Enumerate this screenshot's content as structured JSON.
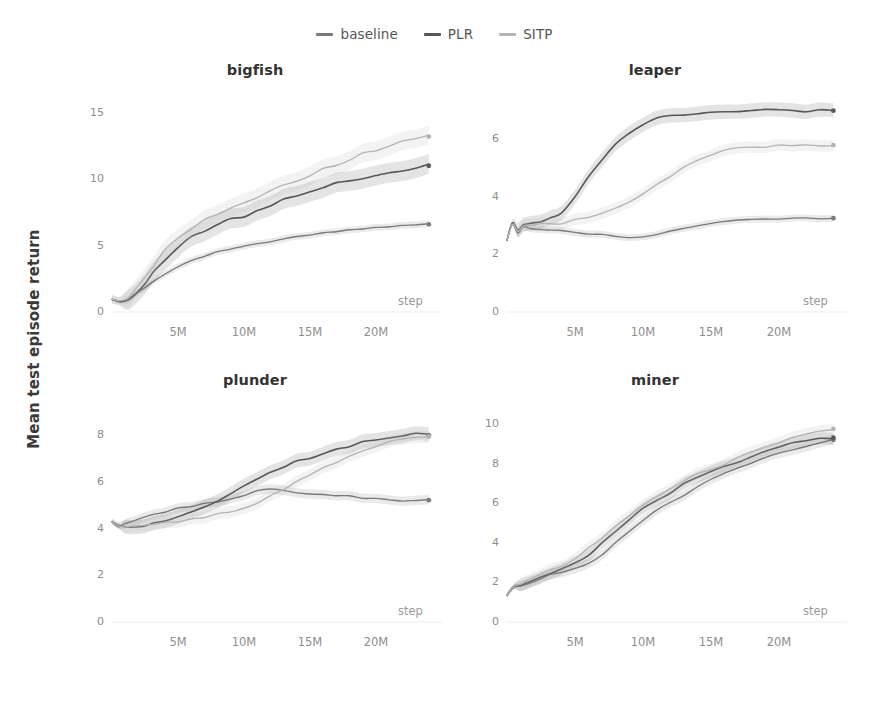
{
  "figure": {
    "ylabel": "Mean test episode return",
    "xaxis_caption": "step",
    "legend": [
      {
        "name": "baseline",
        "color": "#7a7a7a"
      },
      {
        "name": "PLR",
        "color": "#585858"
      },
      {
        "name": "SITP",
        "color": "#b4b4b4"
      }
    ]
  },
  "chart_data": [
    {
      "type": "line",
      "title": "bigfish",
      "xlabel": "step",
      "ylabel": "Mean test episode return",
      "xlim": [
        0,
        25
      ],
      "ylim": [
        0,
        15.8
      ],
      "xticks": [
        5,
        10,
        15,
        20
      ],
      "xticklabels": [
        "5M",
        "10M",
        "15M",
        "20M"
      ],
      "yticks": [
        0,
        5,
        10,
        15
      ],
      "yticklabels": [
        "0",
        "5",
        "10",
        "15"
      ],
      "grid": false,
      "legend_position": "figure-top-center",
      "x": [
        0,
        0.6,
        1.2,
        1.8,
        2.5,
        3.2,
        4,
        5,
        6,
        7,
        8,
        9,
        10,
        11,
        12,
        13,
        14,
        15,
        16,
        17,
        18,
        19,
        20,
        21,
        22,
        23,
        24
      ],
      "series": [
        {
          "name": "baseline",
          "color": "#7a7a7a",
          "values": [
            0.95,
            0.75,
            0.95,
            1.35,
            1.85,
            2.3,
            2.8,
            3.4,
            3.85,
            4.2,
            4.5,
            4.75,
            4.95,
            5.1,
            5.3,
            5.5,
            5.65,
            5.8,
            5.95,
            6.05,
            6.15,
            6.25,
            6.35,
            6.45,
            6.5,
            6.55,
            6.6
          ],
          "band": 0.25,
          "endpoint": 6.6
        },
        {
          "name": "PLR",
          "color": "#585858",
          "values": [
            0.95,
            0.8,
            1.0,
            1.5,
            2.2,
            3.0,
            3.9,
            4.9,
            5.6,
            6.1,
            6.6,
            7.0,
            7.2,
            7.7,
            8.1,
            8.4,
            8.7,
            9.1,
            9.4,
            9.6,
            9.85,
            10.1,
            10.3,
            10.5,
            10.7,
            10.85,
            11.0
          ],
          "band": 0.75,
          "endpoint": 11.0
        },
        {
          "name": "SITP",
          "color": "#b4b4b4",
          "values": [
            0.95,
            0.85,
            1.1,
            1.8,
            2.7,
            3.6,
            4.6,
            5.6,
            6.3,
            6.9,
            7.4,
            7.8,
            8.2,
            8.7,
            9.1,
            9.5,
            9.9,
            10.3,
            10.7,
            11.1,
            11.5,
            11.9,
            12.2,
            12.5,
            12.8,
            13.0,
            13.2
          ],
          "band": 0.7,
          "endpoint": 13.2
        }
      ]
    },
    {
      "type": "line",
      "title": "leaper",
      "xlabel": "step",
      "ylabel": "Mean test episode return",
      "xlim": [
        0,
        25
      ],
      "ylim": [
        0,
        7.3
      ],
      "xticks": [
        5,
        10,
        15,
        20
      ],
      "xticklabels": [
        "5M",
        "10M",
        "15M",
        "20M"
      ],
      "yticks": [
        0,
        2,
        4,
        6
      ],
      "yticklabels": [
        "0",
        "2",
        "4",
        "6"
      ],
      "grid": false,
      "legend_position": "figure-top-center",
      "x": [
        0,
        0.4,
        0.8,
        1.2,
        1.8,
        2.5,
        3.2,
        4,
        5,
        6,
        7,
        8,
        9,
        10,
        11,
        12,
        13,
        14,
        15,
        16,
        17,
        18,
        19,
        20,
        21,
        22,
        23,
        24
      ],
      "series": [
        {
          "name": "baseline",
          "color": "#7a7a7a",
          "values": [
            2.5,
            3.05,
            2.75,
            2.95,
            2.9,
            2.88,
            2.85,
            2.82,
            2.78,
            2.72,
            2.68,
            2.62,
            2.58,
            2.6,
            2.68,
            2.8,
            2.9,
            3.0,
            3.08,
            3.14,
            3.18,
            3.2,
            3.22,
            3.24,
            3.25,
            3.25,
            3.26,
            3.26
          ],
          "band": 0.12,
          "endpoint": 3.26
        },
        {
          "name": "PLR",
          "color": "#585858",
          "values": [
            2.5,
            3.1,
            2.85,
            3.05,
            3.1,
            3.15,
            3.25,
            3.45,
            4.0,
            4.7,
            5.3,
            5.85,
            6.25,
            6.55,
            6.75,
            6.85,
            6.88,
            6.9,
            6.92,
            6.95,
            6.97,
            6.98,
            7.0,
            7.0,
            7.0,
            7.0,
            7.0,
            7.0
          ],
          "band": 0.25,
          "endpoint": 7.0
        },
        {
          "name": "SITP",
          "color": "#b4b4b4",
          "values": [
            2.5,
            3.05,
            2.8,
            3.0,
            3.02,
            3.05,
            3.08,
            3.1,
            3.2,
            3.3,
            3.42,
            3.6,
            3.85,
            4.1,
            4.4,
            4.7,
            5.0,
            5.25,
            5.45,
            5.6,
            5.68,
            5.72,
            5.75,
            5.77,
            5.78,
            5.79,
            5.8,
            5.8
          ],
          "band": 0.2,
          "endpoint": 5.8
        }
      ]
    },
    {
      "type": "line",
      "title": "plunder",
      "xlabel": "step",
      "ylabel": "Mean test episode return",
      "xlim": [
        0,
        25
      ],
      "ylim": [
        0,
        9.0
      ],
      "xticks": [
        5,
        10,
        15,
        20
      ],
      "xticklabels": [
        "5M",
        "10M",
        "15M",
        "20M"
      ],
      "yticks": [
        0,
        2,
        4,
        6,
        8
      ],
      "yticklabels": [
        "0",
        "2",
        "4",
        "6",
        "8"
      ],
      "grid": false,
      "legend_position": "figure-top-center",
      "x": [
        0,
        0.5,
        1,
        1.6,
        2.4,
        3.2,
        4,
        5,
        6,
        7,
        8,
        9,
        10,
        11,
        12,
        13,
        14,
        15,
        16,
        17,
        18,
        19,
        20,
        21,
        22,
        23,
        24
      ],
      "series": [
        {
          "name": "baseline",
          "color": "#7a7a7a",
          "values": [
            4.3,
            4.08,
            4.2,
            4.35,
            4.5,
            4.62,
            4.72,
            4.85,
            4.95,
            5.05,
            5.15,
            5.3,
            5.45,
            5.6,
            5.7,
            5.65,
            5.55,
            5.48,
            5.45,
            5.42,
            5.38,
            5.32,
            5.28,
            5.22,
            5.2,
            5.2,
            5.22
          ],
          "band": 0.2,
          "endpoint": 5.22
        },
        {
          "name": "PLR",
          "color": "#585858",
          "values": [
            4.3,
            4.15,
            4.05,
            4.08,
            4.12,
            4.2,
            4.3,
            4.5,
            4.7,
            4.9,
            5.2,
            5.5,
            5.85,
            6.1,
            6.4,
            6.65,
            6.9,
            7.05,
            7.2,
            7.4,
            7.55,
            7.7,
            7.82,
            7.9,
            7.98,
            8.05,
            8.0
          ],
          "band": 0.3,
          "endpoint": 8.0
        },
        {
          "name": "SITP",
          "color": "#b4b4b4",
          "values": [
            4.3,
            4.12,
            4.05,
            4.1,
            4.15,
            4.2,
            4.25,
            4.32,
            4.4,
            4.5,
            4.62,
            4.72,
            4.85,
            5.1,
            5.4,
            5.7,
            6.0,
            6.3,
            6.6,
            6.85,
            7.1,
            7.35,
            7.55,
            7.7,
            7.85,
            7.92,
            7.95
          ],
          "band": 0.25,
          "endpoint": 7.95
        }
      ]
    },
    {
      "type": "line",
      "title": "miner",
      "xlabel": "step",
      "ylabel": "Mean test episode return",
      "xlim": [
        0,
        25
      ],
      "ylim": [
        0,
        10.6
      ],
      "xticks": [
        5,
        10,
        15,
        20
      ],
      "xticklabels": [
        "5M",
        "10M",
        "15M",
        "20M"
      ],
      "yticks": [
        0,
        2,
        4,
        6,
        8,
        10
      ],
      "yticklabels": [
        "0",
        "2",
        "4",
        "6",
        "8",
        "10"
      ],
      "grid": false,
      "legend_position": "figure-top-center",
      "x": [
        0,
        0.5,
        1,
        1.6,
        2.4,
        3.2,
        4,
        5,
        6,
        7,
        8,
        9,
        10,
        11,
        12,
        13,
        14,
        15,
        16,
        17,
        18,
        19,
        20,
        21,
        22,
        23,
        24
      ],
      "series": [
        {
          "name": "baseline",
          "color": "#7a7a7a",
          "values": [
            1.35,
            1.75,
            1.85,
            1.95,
            2.15,
            2.4,
            2.55,
            2.7,
            2.95,
            3.4,
            4.0,
            4.6,
            5.1,
            5.6,
            6.0,
            6.4,
            6.8,
            7.2,
            7.5,
            7.8,
            8.05,
            8.3,
            8.5,
            8.7,
            8.9,
            9.05,
            9.2
          ],
          "band": 0.25,
          "endpoint": 9.2
        },
        {
          "name": "PLR",
          "color": "#585858",
          "values": [
            1.35,
            1.8,
            1.9,
            2.0,
            2.25,
            2.5,
            2.7,
            2.95,
            3.4,
            4.0,
            4.6,
            5.2,
            5.7,
            6.15,
            6.55,
            6.95,
            7.3,
            7.6,
            7.85,
            8.1,
            8.35,
            8.6,
            8.8,
            9.0,
            9.15,
            9.25,
            9.3
          ],
          "band": 0.3,
          "endpoint": 9.3
        },
        {
          "name": "SITP",
          "color": "#b4b4b4",
          "values": [
            1.35,
            1.8,
            1.95,
            2.1,
            2.35,
            2.6,
            2.85,
            3.2,
            3.7,
            4.3,
            4.85,
            5.35,
            5.85,
            6.3,
            6.7,
            7.1,
            7.45,
            7.75,
            8.0,
            8.3,
            8.55,
            8.8,
            9.05,
            9.3,
            9.5,
            9.65,
            9.75
          ],
          "band": 0.3,
          "endpoint": 9.75
        }
      ]
    }
  ]
}
